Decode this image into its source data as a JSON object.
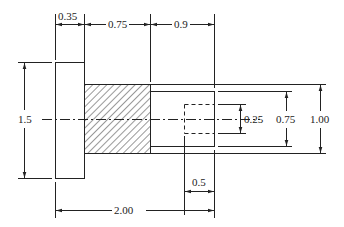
{
  "drawing": {
    "title": "Stepped shaft dimensioned drawing",
    "line_color": "#222222",
    "hatch_color": "#333333",
    "dimensions": {
      "flange_length": "0.35",
      "hatched_length": "0.75",
      "right_length": "0.9",
      "flange_diameter": "1.5",
      "hole_diameter": "0.25",
      "right_diameter": "0.75",
      "hatched_diameter": "1.00",
      "hole_depth": "0.5",
      "overall_length": "2.00"
    }
  }
}
